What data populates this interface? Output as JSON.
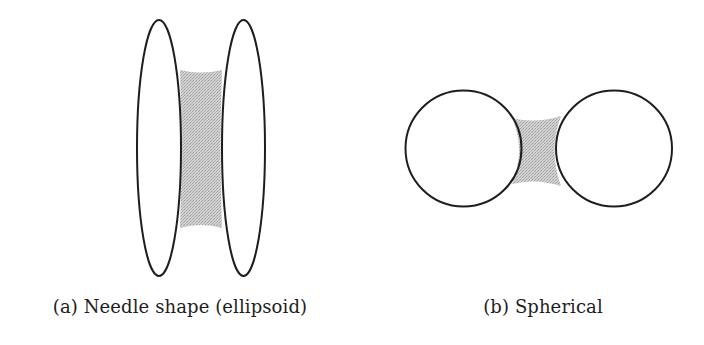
{
  "figure": {
    "background": "#ffffff",
    "stroke_color": "#1e1e1e",
    "fill_color": "#c4c4c4",
    "panels": [
      {
        "id": "a",
        "caption": "(a) Needle shape (ellipsoid)",
        "shape": "ellipsoid",
        "bodies": [
          {
            "cx": 159,
            "cy": 148,
            "rx": 22,
            "ry": 128
          },
          {
            "cx": 243.5,
            "cy": 148,
            "rx": 21.5,
            "ry": 128
          }
        ],
        "shaded_region": {
          "top": 72,
          "bottom": 228
        }
      },
      {
        "id": "b",
        "caption": "(b) Spherical",
        "shape": "sphere",
        "bodies": [
          {
            "cx": 463.5,
            "cy": 148.5,
            "r": 58
          },
          {
            "cx": 614,
            "cy": 148.5,
            "r": 58
          }
        ],
        "shaded_region": {
          "top": 115,
          "bottom": 186
        }
      }
    ]
  }
}
